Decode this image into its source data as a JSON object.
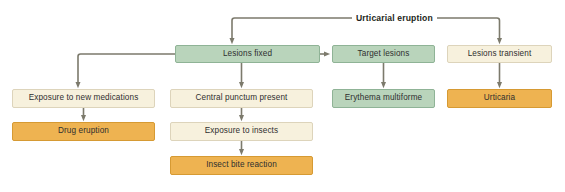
{
  "diagram": {
    "title": "Urticarial eruption",
    "theme": {
      "connector_color": "#7c7a6c",
      "green_fill": "#b9d4bb",
      "green_border": "#8fb396",
      "cream_fill": "#f7f1dd",
      "cream_border": "#ddd4bb",
      "orange_fill": "#eeb351",
      "orange_border": "#d69a33",
      "text_color": "#2f2f2f",
      "background": "#ffffff"
    },
    "root": {
      "label": "Urticarial eruption"
    },
    "nodes": [
      {
        "id": "lesions-fixed",
        "label": "Lesions fixed",
        "style": "green",
        "x": 175,
        "y": 45,
        "w": 145,
        "h": 18
      },
      {
        "id": "target-lesions",
        "label": "Target lesions",
        "style": "green",
        "x": 332,
        "y": 45,
        "w": 103,
        "h": 18
      },
      {
        "id": "lesions-transient",
        "label": "Lesions transient",
        "style": "cream",
        "x": 447,
        "y": 45,
        "w": 105,
        "h": 18
      },
      {
        "id": "exposure-medications",
        "label": "Exposure to new medications",
        "style": "cream",
        "x": 12,
        "y": 89,
        "w": 143,
        "h": 19
      },
      {
        "id": "central-punctum",
        "label": "Central punctum present",
        "style": "cream",
        "x": 170,
        "y": 89,
        "w": 143,
        "h": 19
      },
      {
        "id": "erythema-multiforme",
        "label": "Erythema multiforme",
        "style": "green",
        "x": 332,
        "y": 89,
        "w": 103,
        "h": 19
      },
      {
        "id": "urticaria",
        "label": "Urticaria",
        "style": "orange",
        "x": 447,
        "y": 89,
        "w": 105,
        "h": 19
      },
      {
        "id": "drug-eruption",
        "label": "Drug eruption",
        "style": "orange",
        "x": 12,
        "y": 122,
        "w": 143,
        "h": 19
      },
      {
        "id": "exposure-insects",
        "label": "Exposure to insects",
        "style": "cream",
        "x": 170,
        "y": 122,
        "w": 143,
        "h": 19
      },
      {
        "id": "insect-bite-reaction",
        "label": "Insect bite reaction",
        "style": "orange",
        "x": 170,
        "y": 156,
        "w": 143,
        "h": 19
      }
    ],
    "edges": [
      {
        "id": "root-to-lesions-fixed",
        "from": "root",
        "to": "lesions-fixed"
      },
      {
        "id": "root-to-lesions-transient",
        "from": "root",
        "to": "lesions-transient"
      },
      {
        "id": "lesions-fixed-to-target-lesions",
        "from": "lesions-fixed",
        "to": "target-lesions"
      },
      {
        "id": "lesions-fixed-to-exposure-meds",
        "from": "lesions-fixed",
        "to": "exposure-medications"
      },
      {
        "id": "lesions-fixed-to-central-punctum",
        "from": "lesions-fixed",
        "to": "central-punctum"
      },
      {
        "id": "target-to-erythema",
        "from": "target-lesions",
        "to": "erythema-multiforme"
      },
      {
        "id": "transient-to-urticaria",
        "from": "lesions-transient",
        "to": "urticaria"
      },
      {
        "id": "meds-to-drug-eruption",
        "from": "exposure-medications",
        "to": "drug-eruption"
      },
      {
        "id": "punctum-to-exposure-insects",
        "from": "central-punctum",
        "to": "exposure-insects"
      },
      {
        "id": "insects-to-insect-bite",
        "from": "exposure-insects",
        "to": "insect-bite-reaction"
      }
    ]
  }
}
